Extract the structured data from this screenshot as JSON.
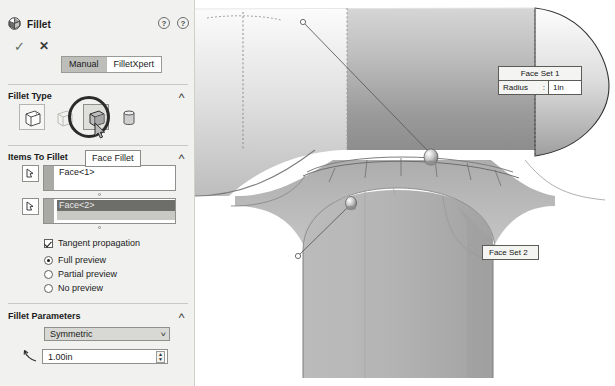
{
  "panel": {
    "title": "Fillet",
    "icons": {
      "help_advanced": "?",
      "help": "?"
    },
    "confirm": {
      "ok": "✓",
      "cancel": "✕"
    },
    "tabs": [
      {
        "label": "Manual",
        "selected": true
      },
      {
        "label": "FilletXpert",
        "selected": false
      }
    ],
    "sections": {
      "fillet_type": {
        "label": "Fillet Type",
        "collapse": "˄",
        "options": [
          {
            "name": "constant-size-fillet",
            "selected": false
          },
          {
            "name": "variable-size-fillet",
            "selected": false
          },
          {
            "name": "face-fillet",
            "selected": true
          },
          {
            "name": "full-round-fillet",
            "selected": false
          }
        ],
        "tooltip": "Face Fillet"
      },
      "items_to_fillet": {
        "label": "Items To Fillet",
        "collapse": "˄",
        "face_set_1": "Face<1>",
        "face_set_2": "Face<2>",
        "checkbox": {
          "label": "Tangent propagation",
          "checked": true
        },
        "preview": [
          {
            "label": "Full preview",
            "selected": true
          },
          {
            "label": "Partial preview",
            "selected": false
          },
          {
            "label": "No preview",
            "selected": false
          }
        ]
      },
      "fillet_parameters": {
        "label": "Fillet Parameters",
        "collapse": "˄",
        "profile": "Symmetric",
        "profile_caret": "˅",
        "radius": "1.00in",
        "spin_up": "▲",
        "spin_down": "▼"
      }
    }
  },
  "viewport": {
    "callout_1": {
      "title": "Face Set 1",
      "radius_label": "Radius",
      "radius_colon": ":",
      "radius_value": "1in"
    },
    "callout_2": {
      "title": "Face Set 2"
    }
  },
  "colors": {
    "panel_bg": "#f1f1ef",
    "model_light": "#d9d9d9",
    "model_mid": "#b2b2b2",
    "model_dark": "#8c8c8c",
    "outline": "#3a3a3a",
    "selection": "#6d6d69"
  }
}
